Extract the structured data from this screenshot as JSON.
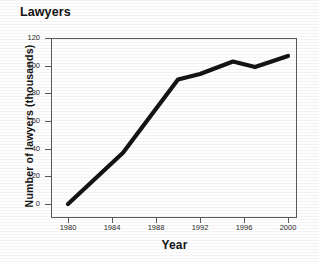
{
  "chart_data": {
    "type": "line",
    "title": "Lawyers",
    "xlabel": "Year",
    "ylabel": "Number of lawyers (thousands)",
    "xlim": [
      1980,
      2001
    ],
    "ylim": [
      0,
      120
    ],
    "grid": false,
    "legend": null,
    "x_ticks": [
      "1980",
      "1984",
      "1988",
      "1992",
      "1996",
      "2000"
    ],
    "x_tick_values": [
      1980,
      1984,
      1988,
      1992,
      1996,
      2000
    ],
    "y_ticks": [
      "0",
      "20",
      "40",
      "60",
      "80",
      "100",
      "120"
    ],
    "y_tick_values": [
      0,
      20,
      40,
      60,
      80,
      100,
      120
    ],
    "line_color": "#141414",
    "series": [
      {
        "name": "Number of lawyers",
        "x": [
          1980,
          1985,
          1990,
          1992,
          1995,
          1997,
          2000
        ],
        "values": [
          0,
          37,
          90,
          94,
          103,
          99,
          107
        ]
      }
    ]
  },
  "labels": {
    "title": "Lawyers",
    "x_axis": "Year",
    "y_axis": "Number of lawyers (thousands)",
    "y0": "0",
    "y20": "20",
    "y40": "40",
    "y60": "60",
    "y80": "80",
    "y100": "100",
    "y120": "120",
    "x1980": "1980",
    "x1984": "1984",
    "x1988": "1988",
    "x1992": "1992",
    "x1996": "1996",
    "x2000": "2000"
  }
}
